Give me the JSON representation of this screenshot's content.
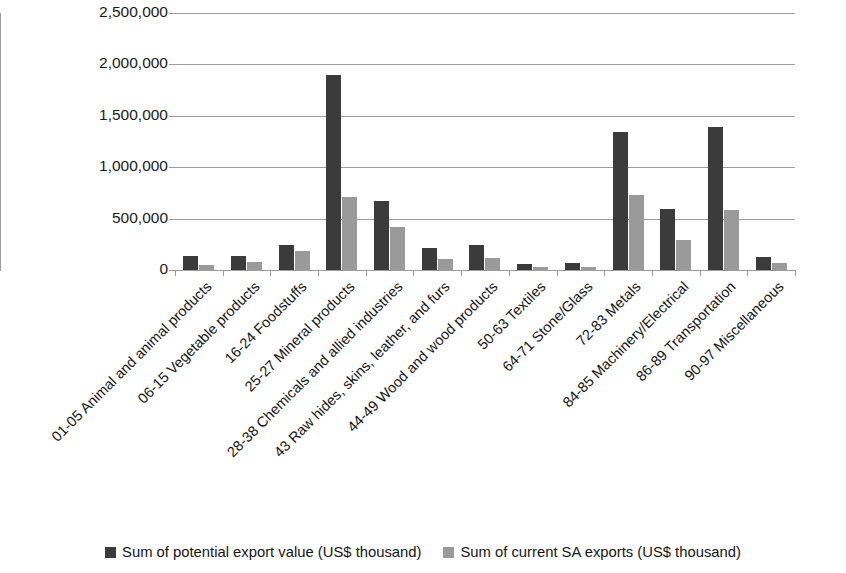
{
  "chart_data": {
    "type": "bar",
    "title": "",
    "subtitle": "",
    "xlabel": "",
    "ylabel": "",
    "ylim": [
      0,
      2500000
    ],
    "ytick_values": [
      0,
      500000,
      1000000,
      1500000,
      2000000,
      2500000
    ],
    "ytick_labels": [
      "0",
      "500,000",
      "1,000,000",
      "1,500,000",
      "2,000,000",
      "2,500,000"
    ],
    "grid": "horizontal",
    "legend_position": "bottom",
    "orientation": "vertical",
    "categories": [
      "01-05 Animal and animal products",
      "06-15 Vegetable products",
      "16-24 Foodstuffs",
      "25-27 Mineral products",
      "28-38 Chemicals and allied industries",
      "43 Raw hides, skins, leather, and furs",
      "44-49 Wood and wood products",
      "50-63 Textiles",
      "64-71 Stone/Glass",
      "72-83 Metals",
      "84-85 Machinery/Electrical",
      "86-89 Transportation",
      "90-97 Miscellaneous"
    ],
    "series": [
      {
        "name": "Sum of potential export value (US$ thousand)",
        "color": "#3b3b3b",
        "values": [
          140000,
          135000,
          245000,
          1900000,
          670000,
          215000,
          240000,
          55000,
          65000,
          1340000,
          595000,
          1390000,
          125000
        ]
      },
      {
        "name": "Sum of current SA exports (US$ thousand)",
        "color": "#9a9a9a",
        "values": [
          50000,
          75000,
          185000,
          715000,
          420000,
          105000,
          115000,
          25000,
          30000,
          725000,
          295000,
          585000,
          70000
        ]
      }
    ]
  },
  "legend": {
    "items": [
      {
        "label": "Sum of potential export value (US$ thousand)",
        "swatch": "dark"
      },
      {
        "label": "Sum of current SA exports (US$ thousand)",
        "swatch": "light"
      }
    ]
  }
}
